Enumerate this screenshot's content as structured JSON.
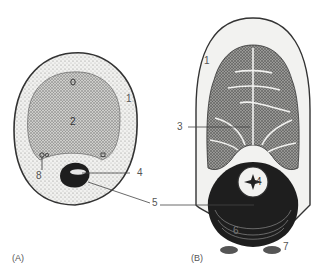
{
  "figure": {
    "panels": [
      {
        "id": "A",
        "caption": "(A)",
        "labels": {
          "l1": "1",
          "l2": "2",
          "l4": "4",
          "l5": "5",
          "l8": "8"
        }
      },
      {
        "id": "B",
        "caption": "(B)",
        "labels": {
          "l1": "1",
          "l3": "3",
          "l4": "4",
          "l6": "6",
          "l7": "7"
        }
      }
    ],
    "colors": {
      "outline": "#333333",
      "stipple": "#9a9a9a",
      "dark_mass": "#1e1e1e",
      "light_fill": "#f2f2f0"
    }
  }
}
